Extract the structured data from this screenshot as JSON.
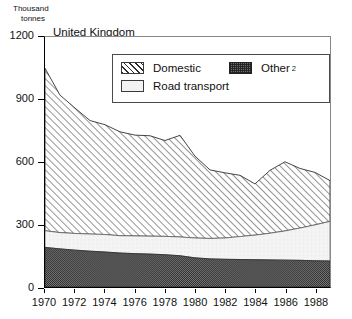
{
  "chart_data": {
    "type": "area",
    "stacked": true,
    "title": "United Kingdom",
    "xlabel": "",
    "ylabel": "Thousand tonnes",
    "ylabel_line1": "Thousand",
    "ylabel_line2": "tonnes",
    "ylim": [
      0,
      1200
    ],
    "xlim": [
      1970,
      1989
    ],
    "yticks": [
      0,
      300,
      600,
      900,
      1200
    ],
    "ytick_labels": [
      "0",
      "300",
      "600",
      "900",
      "1200"
    ],
    "xticks": [
      1970,
      1972,
      1974,
      1976,
      1978,
      1980,
      1982,
      1984,
      1986,
      1988
    ],
    "xtick_labels": [
      "1970",
      "1972",
      "1974",
      "1976",
      "1978",
      "1980",
      "1982",
      "1984",
      "1986",
      "1988"
    ],
    "grid": false,
    "legend_position": "top-center-inside",
    "x": [
      1970,
      1971,
      1972,
      1973,
      1974,
      1975,
      1976,
      1977,
      1978,
      1979,
      1980,
      1981,
      1982,
      1983,
      1984,
      1985,
      1986,
      1987,
      1988,
      1989
    ],
    "series": [
      {
        "name": "Other",
        "footnote": "2",
        "label_full": "Other 2",
        "pattern": "dark-stipple",
        "color": "#6d6d6d",
        "values": [
          190,
          183,
          177,
          172,
          168,
          163,
          160,
          158,
          155,
          150,
          140,
          135,
          133,
          132,
          131,
          130,
          129,
          128,
          126,
          125
        ]
      },
      {
        "name": "Road transport",
        "pattern": "light-fill",
        "color": "#f2f2f2",
        "values": [
          80,
          78,
          80,
          82,
          84,
          83,
          85,
          86,
          88,
          90,
          95,
          98,
          102,
          110,
          118,
          128,
          140,
          155,
          172,
          190
        ]
      },
      {
        "name": "Domestic",
        "pattern": "diagonal-hatch",
        "color": "#ffffff",
        "values": [
          780,
          660,
          602,
          545,
          527,
          499,
          484,
          482,
          460,
          488,
          393,
          329,
          313,
          294,
          246,
          302,
          332,
          286,
          252,
          196
        ]
      }
    ],
    "stack_totals": [
      1050,
      921,
      859,
      799,
      779,
      745,
      729,
      726,
      703,
      728,
      628,
      562,
      548,
      536,
      495,
      560,
      601,
      569,
      550,
      511
    ],
    "cumulative": {
      "other_top": [
        190,
        183,
        177,
        172,
        168,
        163,
        160,
        158,
        155,
        150,
        140,
        135,
        133,
        132,
        131,
        130,
        129,
        128,
        126,
        125
      ],
      "road_top": [
        270,
        261,
        257,
        254,
        252,
        246,
        245,
        244,
        243,
        240,
        235,
        233,
        235,
        242,
        249,
        258,
        269,
        283,
        298,
        315
      ],
      "domestic_top": [
        1050,
        921,
        859,
        799,
        779,
        745,
        729,
        726,
        703,
        728,
        628,
        562,
        548,
        536,
        495,
        560,
        601,
        569,
        550,
        511
      ]
    }
  },
  "legend": {
    "entries": [
      {
        "label": "Domestic",
        "sup": ""
      },
      {
        "label": "Other",
        "sup": "2"
      },
      {
        "label": "Road transport",
        "sup": ""
      }
    ]
  }
}
